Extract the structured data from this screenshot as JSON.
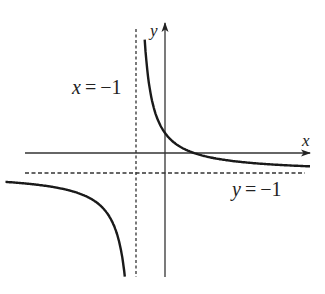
{
  "chart_data": {
    "type": "line",
    "title": "",
    "function": "y = 2/(x+1) - 1",
    "xlabel": "x",
    "ylabel": "y",
    "asymptotes": [
      {
        "type": "vertical",
        "value": -1,
        "label": "x = −1",
        "style": "dashed"
      },
      {
        "type": "horizontal",
        "value": -1,
        "label": "y = −1",
        "style": "dashed"
      }
    ],
    "intercepts": {
      "y_intercept": [
        0,
        1
      ],
      "x_intercept": [
        1,
        0
      ]
    },
    "xlim": [
      -5.5,
      5.0
    ],
    "ylim": [
      -6.1,
      6.5
    ],
    "grid": false,
    "legend": null,
    "series": [
      {
        "name": "right branch",
        "x_range": [
          -0.7,
          5.0
        ]
      },
      {
        "name": "left branch",
        "x_range": [
          -5.5,
          -1.1
        ]
      }
    ]
  },
  "labels": {
    "x_axis": "x",
    "y_axis": "y",
    "vertical_asymptote": {
      "var": "x",
      "eq": "=",
      "val": "−1"
    },
    "horizontal_asymptote": {
      "var": "y",
      "eq": "=",
      "val": "−1"
    }
  },
  "colors": {
    "curve": "#1a1a1a",
    "axis": "#333333",
    "asymptote": "#333333"
  }
}
